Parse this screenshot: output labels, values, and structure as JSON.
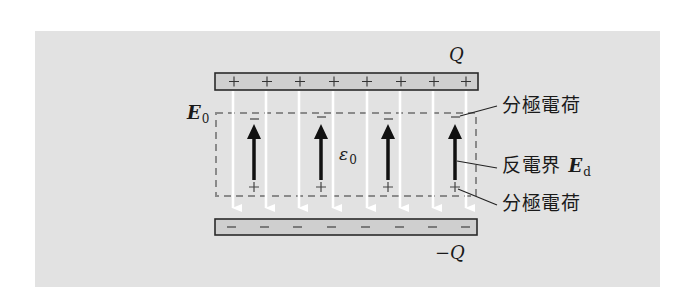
{
  "figure": {
    "background_color": "#e2e2e2",
    "plate_fill": "#cfcfcf",
    "plate_border": "#2a2a2a",
    "field_line_color": "#ffffff",
    "polarization_arrow_color": "#111111",
    "dielectric_outline_color": "#8a8a8a"
  },
  "labels": {
    "top_charge": "Q",
    "bottom_charge": "−Q",
    "external_field_symbol": "E",
    "external_field_subscript": "0",
    "permittivity_symbol": "ε",
    "permittivity_subscript": "0",
    "polarization_charge_top": "分極電荷",
    "depolarizing_field_text": "反電界",
    "depolarizing_field_symbol": "E",
    "depolarizing_field_subscript": "d",
    "polarization_charge_bottom": "分極電荷"
  },
  "plates": {
    "top": {
      "sign": "+",
      "count": 8
    },
    "bottom": {
      "sign": "−",
      "count": 8
    }
  },
  "field_lines": {
    "count": 8,
    "direction": "down"
  },
  "polarization_arrows": {
    "count": 4,
    "direction": "up",
    "top_sign": "−",
    "bottom_sign": "+"
  }
}
